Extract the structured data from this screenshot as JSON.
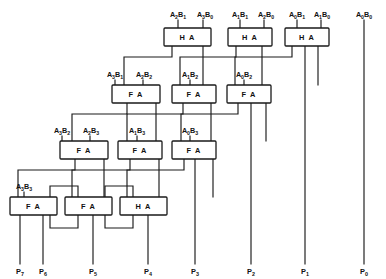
{
  "figure": {
    "stroke_color": "#1a1a1a",
    "background_color": "#ffffff"
  },
  "adders": [
    {
      "id": "ha-r0-c0",
      "type": "HA",
      "label": "H A",
      "row": 0,
      "col": 0,
      "x": 164,
      "y": 28,
      "w": 47,
      "h": 18
    },
    {
      "id": "ha-r0-c1",
      "type": "HA",
      "label": "H A",
      "row": 0,
      "col": 1,
      "x": 228,
      "y": 28,
      "w": 43,
      "h": 18
    },
    {
      "id": "ha-r0-c2",
      "type": "HA",
      "label": "H A",
      "row": 0,
      "col": 2,
      "x": 285,
      "y": 28,
      "w": 43,
      "h": 18
    },
    {
      "id": "fa-r1-c0",
      "type": "FA",
      "label": "F A",
      "row": 1,
      "col": 0,
      "x": 119,
      "y": 85,
      "w": 45,
      "h": 18
    },
    {
      "id": "fa-r1-c1",
      "type": "FA",
      "label": "F A",
      "row": 1,
      "col": 1,
      "x": 175,
      "y": 85,
      "w": 43,
      "h": 18
    },
    {
      "id": "fa-r1-c2",
      "type": "FA",
      "label": "F A",
      "row": 1,
      "col": 2,
      "x": 230,
      "y": 85,
      "w": 43,
      "h": 18
    },
    {
      "id": "fa-r2-c0",
      "type": "FA",
      "label": "F A",
      "row": 2,
      "col": 0,
      "x": 67,
      "y": 141,
      "w": 45,
      "h": 18
    },
    {
      "id": "fa-r2-c1",
      "type": "FA",
      "label": "F A",
      "row": 2,
      "col": 1,
      "x": 122,
      "y": 141,
      "w": 43,
      "h": 18
    },
    {
      "id": "fa-r2-c2",
      "type": "FA",
      "label": "F A",
      "row": 2,
      "col": 2,
      "x": 176,
      "y": 141,
      "w": 43,
      "h": 18
    },
    {
      "id": "fa-r3-c0",
      "type": "FA",
      "label": "F A",
      "row": 3,
      "col": 0,
      "x": 12,
      "y": 197,
      "w": 45,
      "h": 18
    },
    {
      "id": "fa-r3-c1",
      "type": "FA",
      "label": "F A",
      "row": 3,
      "col": 1,
      "x": 67,
      "y": 197,
      "w": 45,
      "h": 18
    },
    {
      "id": "ha-r3-c2",
      "type": "HA",
      "label": "H A",
      "row": 3,
      "col": 2,
      "x": 122,
      "y": 197,
      "w": 45,
      "h": 18
    }
  ],
  "input_labels": [
    {
      "id": "in-a2b1",
      "a": "A",
      "ai": "2",
      "b": "B",
      "bi": "1",
      "text": "A2B1",
      "x": 178,
      "y": 15
    },
    {
      "id": "in-a3b0",
      "a": "A",
      "ai": "3",
      "b": "B",
      "bi": "0",
      "text": "A3B0",
      "x": 208,
      "y": 15
    },
    {
      "id": "in-a1b1",
      "a": "A",
      "ai": "1",
      "b": "B",
      "bi": "1",
      "text": "A1B1",
      "x": 240,
      "y": 15
    },
    {
      "id": "in-a2b0",
      "a": "A",
      "ai": "2",
      "b": "B",
      "bi": "0",
      "text": "A2B0",
      "x": 269,
      "y": 15
    },
    {
      "id": "in-a0b1",
      "a": "A",
      "ai": "0",
      "b": "B",
      "bi": "1",
      "text": "A0B1",
      "x": 297,
      "y": 15
    },
    {
      "id": "in-a1b0",
      "a": "A",
      "ai": "1",
      "b": "B",
      "bi": "0",
      "text": "A1B0",
      "x": 325,
      "y": 15
    },
    {
      "id": "in-a0b0",
      "a": "A",
      "ai": "0",
      "b": "B",
      "bi": "0",
      "text": "A0B0",
      "x": 364,
      "y": 15
    },
    {
      "id": "in-a3b1",
      "a": "A",
      "ai": "3",
      "b": "B",
      "bi": "1",
      "text": "A3B1",
      "x": 115,
      "y": 75
    },
    {
      "id": "in-a2b2",
      "a": "A",
      "ai": "2",
      "b": "B",
      "bi": "2",
      "text": "A2B2",
      "x": 145,
      "y": 75
    },
    {
      "id": "in-a1b2",
      "a": "A",
      "ai": "1",
      "b": "B",
      "bi": "2",
      "text": "A1B2",
      "x": 190,
      "y": 75
    },
    {
      "id": "in-a0b2",
      "a": "A",
      "ai": "0",
      "b": "B",
      "bi": "2",
      "text": "A0B2",
      "x": 244,
      "y": 75
    },
    {
      "id": "in-a3b2",
      "a": "A",
      "ai": "3",
      "b": "B",
      "bi": "2",
      "text": "A3B2",
      "x": 62,
      "y": 131
    },
    {
      "id": "in-a2b3",
      "a": "A",
      "ai": "2",
      "b": "B",
      "bi": "3",
      "text": "A2B3",
      "x": 92,
      "y": 131
    },
    {
      "id": "in-a1b3",
      "a": "A",
      "ai": "1",
      "b": "B",
      "bi": "3",
      "text": "A1B3",
      "x": 137,
      "y": 131
    },
    {
      "id": "in-a0b3",
      "a": "A",
      "ai": "0",
      "b": "B",
      "bi": "3",
      "text": "A0B3",
      "x": 190,
      "y": 131
    },
    {
      "id": "in-a3b3",
      "a": "A",
      "ai": "3",
      "b": "B",
      "bi": "3",
      "text": "A3B3",
      "x": 17,
      "y": 187
    }
  ],
  "output_labels": [
    {
      "id": "out-p7",
      "p": "P",
      "idx": "7",
      "text": "P7",
      "x": 20,
      "y": 272
    },
    {
      "id": "out-p6",
      "p": "P",
      "idx": "6",
      "text": "P6",
      "x": 43,
      "y": 272
    },
    {
      "id": "out-p5",
      "p": "P",
      "idx": "5",
      "text": "P5",
      "x": 93,
      "y": 272
    },
    {
      "id": "out-p4",
      "p": "P",
      "idx": "4",
      "text": "P4",
      "x": 148,
      "y": 272
    },
    {
      "id": "out-p3",
      "p": "P",
      "idx": "3",
      "text": "P3",
      "x": 195,
      "y": 272
    },
    {
      "id": "out-p2",
      "p": "P",
      "idx": "2",
      "text": "P2",
      "x": 251,
      "y": 272
    },
    {
      "id": "out-p1",
      "p": "P",
      "idx": "1",
      "text": "P1",
      "x": 305,
      "y": 272
    },
    {
      "id": "out-p0",
      "p": "P",
      "idx": "0",
      "text": "P0",
      "x": 364,
      "y": 272
    }
  ],
  "wires": {
    "input_stubs": [
      "M178,20 L178,28",
      "M208,20 L208,28",
      "M240,20 L240,28",
      "M269,20 L269,28",
      "M297,20 L297,28",
      "M325,20 L325,28",
      "M115,80 L115,85",
      "M145,80 L145,85",
      "M190,80 L190,85",
      "M244,80 L244,85",
      "M62,136 L62,141",
      "M92,136 L92,141",
      "M137,136 L137,141",
      "M190,136 L190,141",
      "M24,192 L24,197"
    ],
    "long_verticals": [
      "M364,20 L364,265",
      "M305,46 L305,265",
      "M251,103 L251,265",
      "M195,159 L195,265",
      "M148,215 L148,265",
      "M93,215 L93,265",
      "M43,215 L43,265",
      "M20,215 L20,265"
    ],
    "carry_sum_links": [
      "M172,46 L172,56 L119,56 L119,85",
      "M236,46 L236,56 L175,56 L175,85",
      "M292,46 L292,56 L230,56 L230,85",
      "M127,103 L127,113 L67,113 L67,141",
      "M183,103 L183,113 L122,113 L122,141",
      "M238,103 L238,113 L176,113 L176,141",
      "M75,159 L75,169 L12,169 L12,197",
      "M130,159 L130,169 L67,169 L67,197",
      "M184,159 L184,169 L122,169 L122,197",
      "M104,159 L104,182 L57,182 L57,197",
      "M158,159 L158,182 L112,182 L112,197",
      "M212,159 L212,182 L167,182 L167,197",
      "M57,215 L57,228 L37,228 L37,215",
      "M112,215 L112,228 L84,228 L84,215",
      "M167,215 L167,228 L140,228 L140,215",
      "M204,46 L204,85",
      "M260,46 L260,85",
      "M316,46 L316,85",
      "M156,103 L156,141",
      "M211,103 L211,141",
      "M266,103 L266,141",
      "M104,159 L104,197",
      "M159,159 L159,197"
    ],
    "box_pin_stubs": [
      "M155,46 L155,85",
      "M211,46 L211,85",
      "M267,46 L267,85",
      "M140,103 L140,141",
      "M196,103 L196,141",
      "M251,103 L251,141",
      "M88,159 L88,197",
      "M143,159 L143,197"
    ]
  }
}
